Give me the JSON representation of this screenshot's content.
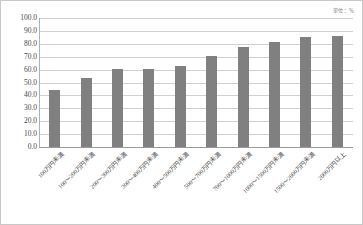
{
  "unit_label": "単位：％",
  "colors": {
    "bar": "#808080",
    "gridline": "#d0d0d0",
    "axis": "#9a9a9a",
    "text": "#4a4a4a",
    "border": "#c8c8c8",
    "background": "#ffffff"
  },
  "chart_data": {
    "type": "bar",
    "title": "",
    "subtitle": "",
    "xlabel": "",
    "ylabel": "",
    "unit": "単位：％",
    "ylim": [
      0.0,
      100.0
    ],
    "ytick_step": 10.0,
    "grid": true,
    "legend": "none",
    "ytick_labels": [
      "100.0",
      "90.0",
      "80.0",
      "70.0",
      "60.0",
      "50.0",
      "40.0",
      "30.0",
      "20.0",
      "10.0",
      "0.0"
    ],
    "ytick_values": [
      100.0,
      90.0,
      80.0,
      70.0,
      60.0,
      50.0,
      40.0,
      30.0,
      20.0,
      10.0,
      0.0
    ],
    "categories": [
      "100万円未満",
      "100〜200万円未満",
      "200〜300万円未満",
      "300〜400万円未満",
      "400〜500万円未満",
      "500〜700万円未満",
      "700〜1000万円未満",
      "1000〜1500万円未満",
      "1500〜2000万円未満",
      "2000万円以上"
    ],
    "values": [
      44.3,
      53.2,
      60.5,
      60.5,
      62.5,
      70.5,
      77.2,
      81.5,
      85.3,
      86.0
    ]
  }
}
